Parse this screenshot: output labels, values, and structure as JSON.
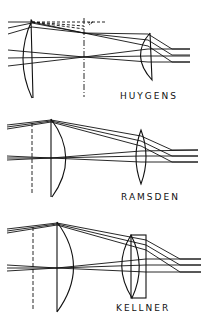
{
  "diagram": {
    "colors": {
      "ink": "#111111",
      "background": "#ffffff"
    },
    "panels": [
      {
        "id": "huygens",
        "label": "HUYGENS",
        "elements": [
          "field-lens",
          "field-stop",
          "eye-lens",
          "rays"
        ]
      },
      {
        "id": "ramsden",
        "label": "RAMSDEN",
        "elements": [
          "field-stop",
          "field-lens",
          "eye-lens",
          "rays"
        ]
      },
      {
        "id": "kellner",
        "label": "KELLNER",
        "elements": [
          "field-stop",
          "field-lens",
          "achromatic-eye-doublet",
          "rays"
        ]
      }
    ]
  }
}
